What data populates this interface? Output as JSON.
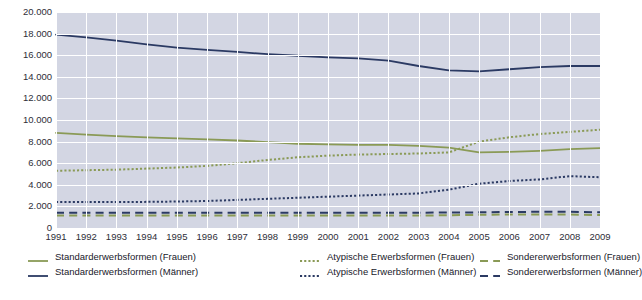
{
  "chart_data": {
    "type": "line",
    "title": "",
    "xlabel": "",
    "ylabel": "",
    "grid": true,
    "legend_position": "bottom",
    "ylim": [
      0,
      20000
    ],
    "y_ticks": [
      0,
      2000,
      4000,
      6000,
      8000,
      10000,
      12000,
      14000,
      16000,
      18000,
      20000
    ],
    "y_tick_labels": [
      "0",
      "2.000",
      "4.000",
      "6.000",
      "8.000",
      "10.000",
      "12.000",
      "14.000",
      "16.000",
      "18.000",
      "20.000"
    ],
    "categories": [
      "1991",
      "1992",
      "1993",
      "1994",
      "1995",
      "1996",
      "1997",
      "1998",
      "1999",
      "2000",
      "2001",
      "2002",
      "2003",
      "2004",
      "2005",
      "2006",
      "2007",
      "2008",
      "2009"
    ],
    "x": [
      1991,
      1992,
      1993,
      1994,
      1995,
      1996,
      1997,
      1998,
      1999,
      2000,
      2001,
      2002,
      2003,
      2004,
      2005,
      2006,
      2007,
      2008,
      2009
    ],
    "series": [
      {
        "name": "Standarderwerbsformen (Frauen)",
        "color": "#8a9a56",
        "style": "solid",
        "values": [
          8800,
          8650,
          8500,
          8400,
          8300,
          8200,
          8100,
          7950,
          7800,
          7750,
          7700,
          7700,
          7600,
          7450,
          7000,
          7050,
          7150,
          7300,
          7400
        ]
      },
      {
        "name": "Standarderwerbsformen (Männer)",
        "color": "#2b3a63",
        "style": "solid",
        "values": [
          17900,
          17650,
          17350,
          17000,
          16700,
          16500,
          16300,
          16100,
          15950,
          15800,
          15700,
          15500,
          15000,
          14600,
          14500,
          14700,
          14900,
          15000,
          15000
        ]
      },
      {
        "name": "Atypische Erwerbsformen (Frauen)",
        "color": "#8a9a56",
        "style": "dotted",
        "values": [
          5300,
          5350,
          5400,
          5500,
          5600,
          5750,
          6000,
          6300,
          6550,
          6700,
          6800,
          6850,
          6900,
          7000,
          8000,
          8400,
          8700,
          8900,
          9100
        ]
      },
      {
        "name": "Atypische Erwerbsformen (Männer)",
        "color": "#2b3a63",
        "style": "dotted",
        "values": [
          2400,
          2400,
          2400,
          2420,
          2450,
          2500,
          2600,
          2700,
          2800,
          2900,
          3000,
          3100,
          3200,
          3550,
          4100,
          4350,
          4500,
          4800,
          4700
        ]
      },
      {
        "name": "Sondererwerbsformen (Frauen)",
        "color": "#8a9a56",
        "style": "dashed",
        "values": [
          1150,
          1150,
          1150,
          1150,
          1150,
          1150,
          1150,
          1150,
          1150,
          1150,
          1150,
          1150,
          1150,
          1180,
          1220,
          1250,
          1250,
          1250,
          1200
        ]
      },
      {
        "name": "Sondererwerbsformen (Männer)",
        "color": "#2b3a63",
        "style": "dashed",
        "values": [
          1420,
          1420,
          1420,
          1420,
          1420,
          1420,
          1420,
          1420,
          1420,
          1420,
          1420,
          1420,
          1420,
          1430,
          1450,
          1480,
          1500,
          1500,
          1450
        ]
      }
    ]
  },
  "legend": {
    "entries": [
      {
        "label": "Standarderwerbsformen (Frauen)",
        "color": "#8a9a56",
        "style": "solid"
      },
      {
        "label": "Standarderwerbsformen (Männer)",
        "color": "#2b3a63",
        "style": "solid"
      },
      {
        "label": "Atypische Erwerbsformen (Frauen)",
        "color": "#8a9a56",
        "style": "dotted"
      },
      {
        "label": "Atypische Erwerbsformen (Männer)",
        "color": "#2b3a63",
        "style": "dotted"
      },
      {
        "label": "Sondererwerbsformen (Frauen)",
        "color": "#8a9a56",
        "style": "dashed"
      },
      {
        "label": "Sondererwerbsformen (Männer)",
        "color": "#2b3a63",
        "style": "dashed"
      }
    ]
  },
  "footnote": {
    "text": ""
  },
  "colors": {
    "frauen": "#8a9a56",
    "maenner": "#2b3a63",
    "plot_background": "#d3d6e3",
    "gridline": "#ffffff"
  }
}
